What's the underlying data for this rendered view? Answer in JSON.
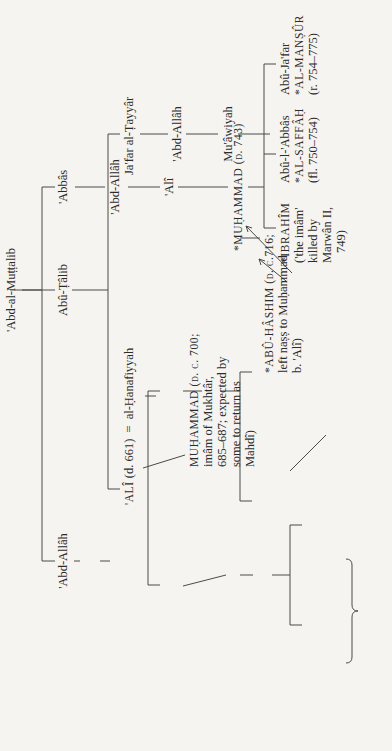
{
  "page": {
    "orientation": "rotated-90-ccw",
    "caption": "Capitals indicate men regarded as imâms in their own lifetime."
  },
  "tree": {
    "root": "'Abd-al-Muṭṭalib",
    "abu_talib": "Abû-Ṭâlib",
    "abbas": "'Abbâs",
    "abd_allah_prophet_father": "'Abd-Allâh",
    "prophet": [
      "Muḥammad (d. 632)",
      "the Prophet"
    ],
    "fatimah": "Fâṭimah",
    "ali": {
      "name": "'ALÎ",
      "note": "(d. 661)"
    },
    "marriage_symbol": "=",
    "marriage_symbol_2": "=",
    "hanafiyyah": "al-Ḥanafiyyah",
    "jafar_tayyar": "Ja'far al-Ṭayyâr",
    "abd_allah_jafar": "'Abd-Allâh",
    "muawiyah": "Mu'âwiyah",
    "abd_allah_muawiyah": [
      "'ABD-ALLÂH",
      "(imâm in",
      "rising of",
      "744–747)"
    ],
    "muhammad_hanafiyyah": [
      "MUḤAMMAD (d. c. 700;",
      "imâm of Mukhtâr,",
      "685–687; expected by",
      "some to return as",
      "Mahdî)"
    ],
    "abu_hashim": [
      "*ABÛ-HÂSHIM (d. c.716;",
      "left naṣṣ to Muḥammad",
      "b. 'Alî)"
    ],
    "abd_allah_abbas": "'Abd-Allâh",
    "ali_abbasid": "'Alî",
    "muhammad_abbasid": "*MUḤAMMAD (d. 743)",
    "ibrahim_imam": [
      "*IBRAHÎM",
      "('the imâm'",
      "killed by",
      "Marwân II,",
      "749)"
    ],
    "saffah": [
      "Abû-l-'Abbâs",
      "*AL-SAFFÂḤ",
      "(fl. 750–754)"
    ],
    "mansur": [
      "Abû-Ja'far",
      "*AL-MANṢÛR",
      "(r. 754–775)"
    ],
    "hasan": [
      "ḤASAN (d. c.669;",
      "resigned 661)"
    ],
    "husayn": [
      "ḤUSAYN (d.680",
      "at Karbalâ')"
    ],
    "hasan_2": "Ḥasan",
    "ali_zayn": "'Alî Zayn-al-'Âbidîn",
    "abd_allah_hasan": "'Abd-Allâh",
    "muhammad_baqir": [
      "*MUḤAMMAD",
      "al-Bâqir",
      "(d. c. 737)"
    ],
    "zayd": [
      "ZAYD",
      "(revolted",
      "in Kûfah,",
      "740)"
    ],
    "jafar_sadiq": [
      "*JA'FAR AL-ṢÂDIQ",
      "(d. 765; prime master",
      "of both Twelver and",
      "Ismâ'îlî Shî'ahs)"
    ],
    "nafs_zakiyyah": [
      "MUḤAMMAD",
      "al-Nafs al-",
      "Zakiyyah"
    ],
    "ibrahim_hasan": "Ibrâhîm",
    "revolt_note": "(Led revolt in 762)"
  }
}
